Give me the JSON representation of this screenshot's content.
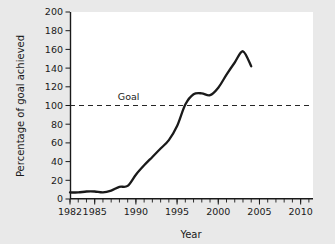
{
  "chart_data": {
    "type": "line",
    "title": "",
    "xlabel": "Year",
    "ylabel": "Percentage of goal achieved",
    "xlim": [
      1982,
      2011.5
    ],
    "ylim": [
      0,
      200
    ],
    "grid": false,
    "legend": null,
    "x_ticks_major": [
      1982,
      1985,
      1990,
      1995,
      2000,
      2005,
      2010
    ],
    "x_tick_labels": [
      "1982",
      "1985",
      "1990",
      "1995",
      "2000",
      "2005",
      "2010"
    ],
    "x_ticks_minor_step": 1,
    "y_ticks": [
      0,
      20,
      40,
      60,
      80,
      100,
      120,
      140,
      160,
      180,
      200
    ],
    "y_tick_labels": [
      "0",
      "20",
      "40",
      "60",
      "80",
      "100",
      "120",
      "140",
      "160",
      "180",
      "200"
    ],
    "annotations": [
      {
        "text": "Goal",
        "x": 1987.8,
        "y": 106,
        "kind": "reference-line-label"
      }
    ],
    "reference_lines": [
      {
        "name": "goal",
        "orientation": "horizontal",
        "y": 100,
        "style": "dashed",
        "label": "Goal"
      }
    ],
    "series": [
      {
        "name": "Percentage of goal achieved",
        "style": "solid",
        "color": "#1a1a1a",
        "x": [
          1982,
          1983,
          1984,
          1985,
          1986,
          1987,
          1988,
          1989,
          1990,
          1991,
          1992,
          1993,
          1994,
          1995,
          1996,
          1997,
          1998,
          1999,
          2000,
          2001,
          2002,
          2003,
          2004
        ],
        "values": [
          7,
          7,
          8,
          8,
          7,
          9,
          13,
          14,
          26,
          36,
          45,
          54,
          63,
          78,
          101,
          112,
          113,
          111,
          119,
          133,
          146,
          158,
          142
        ]
      }
    ]
  },
  "figure": {
    "background_color": "#e9e9e9",
    "plot_background_color": "#ffffff",
    "axis_color": "#1a1a1a"
  }
}
